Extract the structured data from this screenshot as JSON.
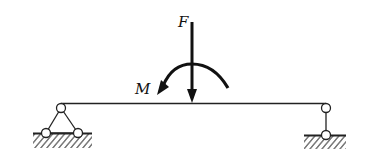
{
  "diagram": {
    "type": "simply supported beam with point load and moment",
    "labels": {
      "force": "F",
      "moment": "M"
    },
    "elements": {
      "beam": "horizontal beam",
      "left_support": "pinned support (triangle with hinge)",
      "right_support": "roller support (link)",
      "force": "downward point load at midspan",
      "moment": "counterclockwise couple at midspan"
    },
    "colors": {
      "stroke": "#1a1a1a",
      "background": "#ffffff"
    }
  }
}
